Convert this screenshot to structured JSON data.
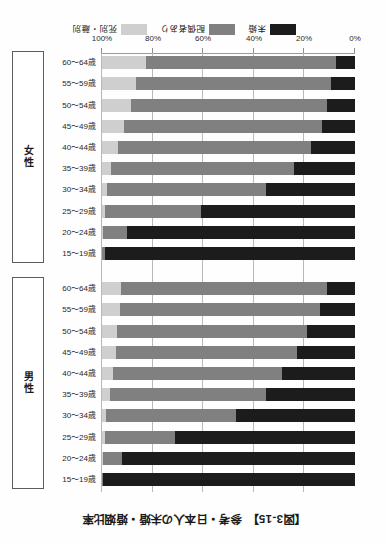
{
  "figure": {
    "title": "【図3-15】　参考・日本人の未婚・婚姻比率"
  },
  "legend": {
    "items": [
      {
        "label": "未婚",
        "color": "#1c1c1c"
      },
      {
        "label": "配偶者あり",
        "color": "#808080"
      },
      {
        "label": "死別・離別",
        "color": "#cfcfcf"
      }
    ]
  },
  "axis": {
    "ticks": [
      "0%",
      "20%",
      "40%",
      "60%",
      "80%",
      "100%"
    ],
    "values": [
      0,
      20,
      40,
      60,
      80,
      100
    ]
  },
  "groups": [
    {
      "label": "男性"
    },
    {
      "label": "女性"
    }
  ],
  "chart_data": {
    "type": "bar",
    "title": "【図3-15】　参考・日本人の未婚・婚姻比率",
    "xlabel": "",
    "ylabel": "",
    "xlim": [
      0,
      100
    ],
    "orientation": "horizontal",
    "stacked": true,
    "stack_total": 100,
    "grid": true,
    "legend_position": "bottom",
    "categories": [
      "15～19歳",
      "20～24歳",
      "25～29歳",
      "30～34歳",
      "35～39歳",
      "40～44歳",
      "45～49歳",
      "50～54歳",
      "55～59歳",
      "60～64歳"
    ],
    "panels": [
      {
        "name": "男性",
        "series": [
          {
            "name": "未婚",
            "color": "#1c1c1c",
            "values": [
              99.5,
              92.0,
              71.0,
              47.0,
              35.0,
              29.0,
              23.0,
              19.0,
              14.0,
              11.0
            ]
          },
          {
            "name": "配偶者あり",
            "color": "#808080",
            "values": [
              0.5,
              7.5,
              28.0,
              51.5,
              62.0,
              66.5,
              71.5,
              75.0,
              79.0,
              81.5
            ]
          },
          {
            "name": "死別・離別",
            "color": "#cfcfcf",
            "values": [
              0.0,
              0.5,
              1.0,
              1.5,
              3.0,
              4.5,
              5.5,
              6.0,
              7.0,
              7.5
            ]
          }
        ]
      },
      {
        "name": "女性",
        "series": [
          {
            "name": "未婚",
            "color": "#1c1c1c",
            "values": [
              99.0,
              90.0,
              61.0,
              35.0,
              24.0,
              17.5,
              13.0,
              11.0,
              9.5,
              7.5
            ]
          },
          {
            "name": "配偶者あり",
            "color": "#808080",
            "values": [
              1.0,
              9.5,
              38.0,
              63.0,
              72.5,
              76.0,
              78.5,
              77.5,
              77.0,
              75.0
            ]
          },
          {
            "name": "死別・離別",
            "color": "#cfcfcf",
            "values": [
              0.0,
              0.5,
              1.0,
              2.0,
              3.5,
              6.5,
              8.5,
              11.5,
              13.5,
              17.5
            ]
          }
        ]
      }
    ]
  }
}
